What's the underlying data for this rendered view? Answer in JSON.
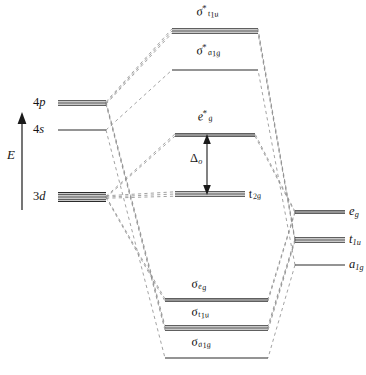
{
  "diagram": {
    "energy_axis_label": "E",
    "colors": {
      "level_line": "#2b2b2b",
      "correlation_line": "#8a8a8a",
      "text": "#141414",
      "background": "#ffffff"
    }
  },
  "metal_orbitals": {
    "caption": "metal atomic orbitals (left column)",
    "items": [
      {
        "id": "4p",
        "label_main": "4",
        "label_sub": "p",
        "degeneracy": 3,
        "y": 103,
        "x1": 58,
        "x2": 106,
        "label_x": 33,
        "label_y": 96
      },
      {
        "id": "4s",
        "label_main": "4",
        "label_sub": "s",
        "degeneracy": 1,
        "y": 130,
        "x1": 58,
        "x2": 106,
        "label_x": 33,
        "label_y": 123
      },
      {
        "id": "3d",
        "label_main": "3",
        "label_sub": "d",
        "degeneracy": 5,
        "y": 197,
        "x1": 58,
        "x2": 106,
        "label_x": 33,
        "label_y": 190
      }
    ]
  },
  "molecular_orbitals": {
    "caption": "molecular orbitals (centre column)",
    "items": [
      {
        "id": "sigma-star-t1u",
        "sym": "σ",
        "starred": true,
        "sub": "t",
        "sub2": "1u",
        "degeneracy": 3,
        "y": 31,
        "x1": 172,
        "x2": 258,
        "label_x": 198,
        "label_y": 5
      },
      {
        "id": "sigma-star-a1g",
        "sym": "σ",
        "starred": true,
        "sub": "a",
        "sub2": "1g",
        "degeneracy": 1,
        "y": 70,
        "x1": 172,
        "x2": 258,
        "label_x": 198,
        "label_y": 44
      },
      {
        "id": "eg-star",
        "sym": "e",
        "starred": true,
        "sub": "g",
        "sub2": "",
        "degeneracy": 2,
        "y": 135,
        "x1": 175,
        "x2": 255,
        "label_x": 199,
        "label_y": 110
      },
      {
        "id": "t2g",
        "sym": "t",
        "starred": false,
        "sub": "2g",
        "sub2": "",
        "degeneracy": 3,
        "y": 194,
        "x1": 175,
        "x2": 245,
        "label_x": 250,
        "label_y": 188
      },
      {
        "id": "sigma-eg",
        "sym": "σ",
        "starred": false,
        "sub": "e",
        "sub2": "g",
        "degeneracy": 2,
        "y": 300,
        "x1": 165,
        "x2": 268,
        "label_x": 193,
        "label_y": 278
      },
      {
        "id": "sigma-t1u",
        "sym": "σ",
        "starred": false,
        "sub": "t",
        "sub2": "1u",
        "degeneracy": 3,
        "y": 328,
        "x1": 165,
        "x2": 268,
        "label_x": 193,
        "label_y": 306
      },
      {
        "id": "sigma-a1g",
        "sym": "σ",
        "starred": false,
        "sub": "a",
        "sub2": "1g",
        "degeneracy": 1,
        "y": 358,
        "x1": 165,
        "x2": 268,
        "label_x": 193,
        "label_y": 336
      }
    ]
  },
  "ligand_orbitals": {
    "caption": "ligand group orbitals (right column)",
    "items": [
      {
        "id": "eg",
        "sym": "e",
        "sub": "g",
        "degeneracy": 2,
        "y": 212,
        "x1": 295,
        "x2": 345,
        "label_x": 349,
        "label_y": 205
      },
      {
        "id": "t1u",
        "sym": "t",
        "sub": "1u",
        "degeneracy": 3,
        "y": 240,
        "x1": 295,
        "x2": 345,
        "label_x": 349,
        "label_y": 233
      },
      {
        "id": "a1g",
        "sym": "a",
        "sub": "1g",
        "degeneracy": 1,
        "y": 265,
        "x1": 295,
        "x2": 345,
        "label_x": 349,
        "label_y": 258
      }
    ]
  },
  "annotations": {
    "splitting": {
      "id": "delta-o",
      "symbol": "Δ",
      "subscript": "o",
      "label_x": 190,
      "label_y": 152,
      "arrow_x": 207,
      "arrow_top": 137,
      "arrow_bottom": 192
    },
    "energy_arrow": {
      "x": 22,
      "top": 118,
      "bottom": 210,
      "label_x": 10,
      "label_y": 155
    }
  },
  "chart_data": {
    "type": "diagram",
    "ylabel": "E",
    "columns": [
      "metal atomic orbitals",
      "molecular orbitals",
      "ligand group orbitals"
    ],
    "levels": [
      {
        "column": "molecular",
        "label": "σ*t1u",
        "degeneracy": 3,
        "relative_energy": 0.94
      },
      {
        "column": "molecular",
        "label": "σ*a1g",
        "degeneracy": 1,
        "relative_energy": 0.83
      },
      {
        "column": "metal",
        "label": "4p",
        "degeneracy": 3,
        "relative_energy": 0.74
      },
      {
        "column": "metal",
        "label": "4s",
        "degeneracy": 1,
        "relative_energy": 0.66
      },
      {
        "column": "molecular",
        "label": "e*g",
        "degeneracy": 2,
        "relative_energy": 0.65
      },
      {
        "column": "metal",
        "label": "3d",
        "degeneracy": 5,
        "relative_energy": 0.48
      },
      {
        "column": "molecular",
        "label": "t2g",
        "degeneracy": 3,
        "relative_energy": 0.48
      },
      {
        "column": "ligand",
        "label": "eg",
        "degeneracy": 2,
        "relative_energy": 0.43
      },
      {
        "column": "ligand",
        "label": "t1u",
        "degeneracy": 3,
        "relative_energy": 0.36
      },
      {
        "column": "ligand",
        "label": "a1g",
        "degeneracy": 1,
        "relative_energy": 0.29
      },
      {
        "column": "molecular",
        "label": "σeg",
        "degeneracy": 2,
        "relative_energy": 0.2
      },
      {
        "column": "molecular",
        "label": "σt1u",
        "degeneracy": 3,
        "relative_energy": 0.12
      },
      {
        "column": "molecular",
        "label": "σa1g",
        "degeneracy": 1,
        "relative_energy": 0.04
      }
    ],
    "annotation": "Δo ligand field splitting between t2g and e*g"
  }
}
